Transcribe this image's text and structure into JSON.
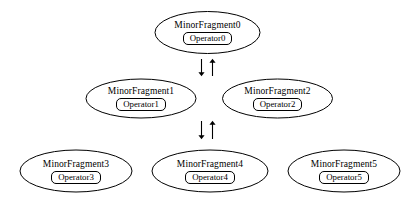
{
  "diagram": {
    "type": "fragment-dependency-graph",
    "background_color": "#ffffff",
    "stroke_color": "#000000",
    "nodes": [
      {
        "id": "minor-fragment-0",
        "title": "MinorFragment0",
        "operator": "Operator0",
        "shape": "ellipse",
        "row": "top",
        "cx": 207.5,
        "cy": 32.5,
        "rx": 52.5,
        "ry": 21.0
      },
      {
        "id": "minor-fragment-1",
        "title": "MinorFragment1",
        "operator": "Operator1",
        "shape": "ellipse",
        "row": "middle",
        "cx": 141.0,
        "cy": 98.5,
        "rx": 55.0,
        "ry": 19.5
      },
      {
        "id": "minor-fragment-2",
        "title": "MinorFragment2",
        "operator": "Operator2",
        "shape": "ellipse",
        "row": "middle",
        "cx": 277.5,
        "cy": 98.5,
        "rx": 55.0,
        "ry": 19.5
      },
      {
        "id": "minor-fragment-3",
        "title": "MinorFragment3",
        "operator": "Operator3",
        "shape": "ellipse",
        "row": "bottom",
        "cx": 76.0,
        "cy": 171.0,
        "rx": 56.0,
        "ry": 21.0
      },
      {
        "id": "minor-fragment-4",
        "title": "MinorFragment4",
        "operator": "Operator4",
        "shape": "ellipse",
        "row": "bottom",
        "cx": 210.0,
        "cy": 171.0,
        "rx": 58.0,
        "ry": 21.0
      },
      {
        "id": "minor-fragment-5",
        "title": "MinorFragment5",
        "operator": "Operator5",
        "shape": "ellipse",
        "row": "bottom",
        "cx": 344.0,
        "cy": 171.0,
        "rx": 56.0,
        "ry": 21.0
      }
    ],
    "connectors": [
      {
        "id": "connector-top-down",
        "direction": "down",
        "x": 201.5,
        "y_start": 59.0,
        "y_end": 76.0
      },
      {
        "id": "connector-top-up",
        "direction": "up",
        "x": 212.5,
        "y_start": 76.0,
        "y_end": 59.0
      },
      {
        "id": "connector-bottom-down",
        "direction": "down",
        "x": 201.5,
        "y_start": 121.0,
        "y_end": 139.0
      },
      {
        "id": "connector-bottom-up",
        "direction": "up",
        "x": 212.5,
        "y_start": 139.0,
        "y_end": 121.0
      }
    ]
  }
}
